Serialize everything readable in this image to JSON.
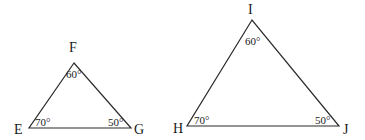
{
  "triangles": [
    {
      "name": "EFG",
      "vertices": {
        "F": {
          "label": "F",
          "angle": "60°"
        },
        "E": {
          "label": "E",
          "angle": "70°"
        },
        "G": {
          "label": "G",
          "angle": "50°"
        }
      }
    },
    {
      "name": "HIJ",
      "vertices": {
        "I": {
          "label": "I",
          "angle": "60°"
        },
        "H": {
          "label": "H",
          "angle": "70°"
        },
        "J": {
          "label": "J",
          "angle": "50°"
        }
      }
    }
  ],
  "colors": {
    "line": "#2a2a2a",
    "text": "#1a1a1a",
    "background": "#ffffff"
  }
}
